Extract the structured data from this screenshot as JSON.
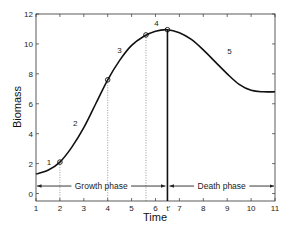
{
  "chart_data": {
    "type": "line",
    "title": "",
    "xlabel": "Time",
    "ylabel": "Biomass",
    "xlim": [
      1,
      11
    ],
    "ylim": [
      -0.5,
      12
    ],
    "grid": false,
    "x_ticks": [
      "1",
      "2",
      "3",
      "4",
      "5",
      "6",
      "t'",
      "7",
      "8",
      "9",
      "10",
      "11"
    ],
    "y_ticks": [
      "0",
      "2",
      "4",
      "6",
      "8",
      "10",
      "12"
    ],
    "series": [
      {
        "name": "Biomass curve",
        "x": [
          1,
          1.5,
          2,
          2.5,
          3,
          3.5,
          4,
          4.5,
          5,
          5.5,
          6,
          6.5,
          7,
          7.5,
          8,
          8.5,
          9,
          9.5,
          10,
          10.5,
          11
        ],
        "y": [
          1.3,
          1.55,
          2.1,
          3.1,
          4.4,
          6.0,
          7.6,
          8.9,
          9.9,
          10.5,
          10.85,
          10.95,
          10.75,
          10.3,
          9.6,
          8.8,
          8.0,
          7.3,
          6.9,
          6.8,
          6.8
        ]
      }
    ],
    "markers": [
      {
        "x": 2,
        "y": 2.1
      },
      {
        "x": 4,
        "y": 7.6
      },
      {
        "x": 5.6,
        "y": 10.6
      },
      {
        "x": 6.5,
        "y": 10.95
      }
    ],
    "annotations": [
      {
        "text": "1",
        "x": 1.45,
        "y": 1.9
      },
      {
        "text": "2",
        "x": 2.55,
        "y": 4.5
      },
      {
        "text": "3",
        "x": 4.4,
        "y": 9.4
      },
      {
        "text": "4",
        "x": 5.95,
        "y": 11.2
      },
      {
        "text": "5",
        "x": 9.0,
        "y": 9.3
      }
    ],
    "vertical_line": {
      "x": 6.5,
      "label": "t'"
    },
    "phases": [
      {
        "label": "Growth phase",
        "x_start": 1,
        "x_end": 6.5,
        "y": 0.5
      },
      {
        "label": "Death phase",
        "x_start": 6.5,
        "x_end": 11,
        "y": 0.5
      }
    ]
  }
}
